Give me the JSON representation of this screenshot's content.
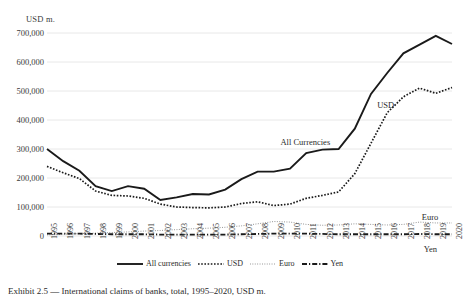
{
  "chart_data": {
    "type": "line",
    "title": "",
    "xlabel": "",
    "ylabel": "USD m.",
    "ylim": [
      0,
      700000
    ],
    "ytick_labels": [
      "0",
      "100,000",
      "200,000",
      "300,000",
      "400,000",
      "500,000",
      "600,000",
      "700,000"
    ],
    "ytick_values": [
      0,
      100000,
      200000,
      300000,
      400000,
      500000,
      600000,
      700000
    ],
    "grid": true,
    "legend_position": "bottom",
    "categories": [
      "1995",
      "1996",
      "1997",
      "1998",
      "1999",
      "2000",
      "2001",
      "2002",
      "2003",
      "2004",
      "2005",
      "2006",
      "2007",
      "2008",
      "2009",
      "2010",
      "2011",
      "2012",
      "2013",
      "2014",
      "2015",
      "2016",
      "2017",
      "2018",
      "2019",
      "2020"
    ],
    "series": [
      {
        "name": "All currencies",
        "style": "solid",
        "color": "#1a1a1a",
        "values": [
          300000,
          258000,
          225000,
          172000,
          155000,
          172000,
          163000,
          124000,
          133000,
          145000,
          143000,
          160000,
          196000,
          222000,
          222000,
          232000,
          286000,
          298000,
          300000,
          370000,
          490000,
          562000,
          630000,
          660000,
          690000,
          662000
        ]
      },
      {
        "name": "USD",
        "style": "dotted",
        "color": "#1a1a1a",
        "values": [
          240000,
          218000,
          198000,
          155000,
          140000,
          138000,
          130000,
          110000,
          100000,
          98000,
          97000,
          100000,
          112000,
          118000,
          105000,
          110000,
          130000,
          140000,
          152000,
          215000,
          320000,
          425000,
          480000,
          510000,
          492000,
          512000
        ]
      },
      {
        "name": "Euro",
        "style": "fine-dotted",
        "color": "#8c8c8c",
        "values": [
          4000,
          6000,
          8000,
          10000,
          12000,
          14000,
          17000,
          19000,
          22000,
          25000,
          27000,
          30000,
          35000,
          42000,
          50000,
          48000,
          40000,
          37000,
          38000,
          42000,
          40000,
          38000,
          40000,
          48000,
          45000,
          45000
        ]
      },
      {
        "name": "Yen",
        "style": "dash-dot",
        "color": "#1a1a1a",
        "values": [
          8000,
          8000,
          8000,
          7000,
          6000,
          6000,
          6000,
          5000,
          5000,
          5000,
          5000,
          5000,
          6000,
          7000,
          8000,
          8000,
          8000,
          7000,
          6000,
          6000,
          6000,
          6000,
          6000,
          7000,
          6000,
          6000
        ]
      }
    ],
    "annotations": [
      {
        "text": "All Currencies",
        "series": "All currencies"
      },
      {
        "text": "USD",
        "series": "USD"
      },
      {
        "text": "Euro",
        "series": "Euro"
      },
      {
        "text": "Yen",
        "series": "Yen"
      }
    ]
  },
  "legend": {
    "items": [
      {
        "label": "All currencies"
      },
      {
        "label": "USD"
      },
      {
        "label": "Euro"
      },
      {
        "label": "Yen"
      }
    ]
  },
  "caption": {
    "text": "Exhibit 2.5 — International claims of banks, total, 1995–2020, USD m."
  }
}
